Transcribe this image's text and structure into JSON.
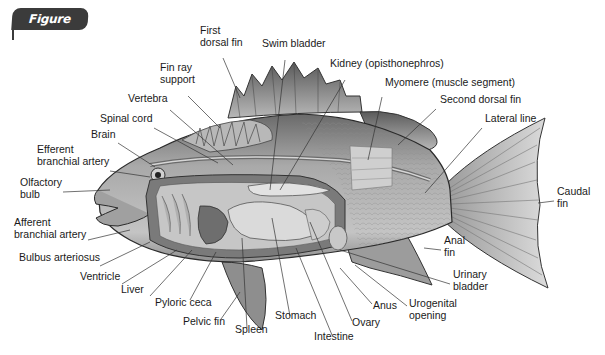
{
  "figure": {
    "badge_label": "Figure 15.20",
    "badge_color": "#3b3b3b"
  },
  "labels": [
    {
      "id": "first-dorsal-fin",
      "text": "First\ndorsal fin",
      "x": 200,
      "y": 34,
      "line": [
        223,
        58,
        240,
        98
      ]
    },
    {
      "id": "swim-bladder",
      "text": "Swim bladder",
      "x": 262,
      "y": 47,
      "line": [
        285,
        60,
        270,
        190
      ]
    },
    {
      "id": "kidney",
      "text": "Kidney (opisthonephros)",
      "x": 330,
      "y": 67,
      "line": [
        345,
        80,
        280,
        190
      ]
    },
    {
      "id": "myomere",
      "text": "Myomere (muscle segment)",
      "x": 385,
      "y": 86,
      "line": [
        382,
        97,
        368,
        160
      ]
    },
    {
      "id": "fin-ray-support",
      "text": "Fin ray\nsupport",
      "x": 160,
      "y": 71,
      "line": [
        188,
        96,
        220,
        128
      ]
    },
    {
      "id": "second-dorsal-fin",
      "text": "Second dorsal fin",
      "x": 440,
      "y": 103,
      "line": [
        436,
        109,
        398,
        145
      ]
    },
    {
      "id": "vertebra",
      "text": "Vertebra",
      "x": 128,
      "y": 102,
      "line": [
        170,
        110,
        233,
        165
      ]
    },
    {
      "id": "lateral-line",
      "text": "Lateral line",
      "x": 485,
      "y": 122,
      "line": [
        482,
        128,
        425,
        193
      ]
    },
    {
      "id": "spinal-cord",
      "text": "Spinal cord",
      "x": 100,
      "y": 122,
      "line": [
        154,
        128,
        218,
        163
      ]
    },
    {
      "id": "brain",
      "text": "Brain",
      "x": 91,
      "y": 138,
      "line": [
        118,
        143,
        155,
        167
      ]
    },
    {
      "id": "efferent-branchial-artery",
      "text": "Efferent\nbranchial artery",
      "x": 37,
      "y": 153,
      "line": [
        110,
        171,
        150,
        177
      ]
    },
    {
      "id": "olfactory-bulb",
      "text": "Olfactory\nbulb",
      "x": 20,
      "y": 186,
      "line": [
        63,
        192,
        110,
        190
      ]
    },
    {
      "id": "caudal-fin",
      "text": "Caudal\nfin",
      "x": 557,
      "y": 195,
      "line": [
        554,
        201,
        538,
        203
      ]
    },
    {
      "id": "afferent-branchial-artery",
      "text": "Afferent\nbranchial artery",
      "x": 14,
      "y": 226,
      "line": [
        88,
        240,
        130,
        230
      ]
    },
    {
      "id": "anal-fin",
      "text": "Anal\nfin",
      "x": 444,
      "y": 244,
      "line": [
        441,
        250,
        424,
        248
      ]
    },
    {
      "id": "bulbus-arteriosus",
      "text": "Bulbus arteriosus",
      "x": 19,
      "y": 261,
      "line": [
        100,
        266,
        150,
        242
      ]
    },
    {
      "id": "ventricle",
      "text": "Ventricle",
      "x": 80,
      "y": 280,
      "line": [
        122,
        284,
        177,
        250
      ]
    },
    {
      "id": "urinary-bladder",
      "text": "Urinary\nbladder",
      "x": 453,
      "y": 278,
      "line": [
        450,
        284,
        340,
        250
      ]
    },
    {
      "id": "liver",
      "text": "Liver",
      "x": 121,
      "y": 293,
      "line": [
        150,
        296,
        192,
        250
      ]
    },
    {
      "id": "pyloric-ceca",
      "text": "Pyloric ceca",
      "x": 155,
      "y": 306,
      "line": [
        190,
        300,
        216,
        252
      ]
    },
    {
      "id": "anus",
      "text": "Anus",
      "x": 373,
      "y": 309,
      "line": [
        372,
        304,
        340,
        268
      ]
    },
    {
      "id": "urogenital-opening",
      "text": "Urogenital\nopening",
      "x": 409,
      "y": 307,
      "line": [
        407,
        306,
        355,
        265
      ]
    },
    {
      "id": "pelvic-fin",
      "text": "Pelvic fin",
      "x": 183,
      "y": 325,
      "line": [
        221,
        319,
        240,
        292
      ]
    },
    {
      "id": "stomach",
      "text": "Stomach",
      "x": 275,
      "y": 319,
      "line": [
        290,
        316,
        272,
        218
      ]
    },
    {
      "id": "ovary",
      "text": "Ovary",
      "x": 352,
      "y": 326,
      "line": [
        352,
        321,
        310,
        222
      ]
    },
    {
      "id": "spleen",
      "text": "Spleen",
      "x": 235,
      "y": 333,
      "line": [
        247,
        328,
        242,
        238
      ]
    },
    {
      "id": "intestine",
      "text": "Intestine",
      "x": 314,
      "y": 340,
      "line": [
        332,
        335,
        296,
        248
      ]
    }
  ]
}
